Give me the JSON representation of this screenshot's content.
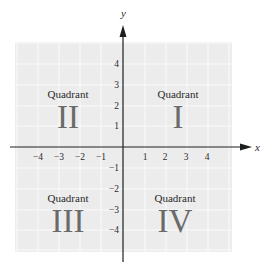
{
  "diagram": {
    "axes": {
      "x_label": "x",
      "y_label": "y"
    },
    "x_ticks": [
      {
        "value": -4,
        "label": "−4"
      },
      {
        "value": -3,
        "label": "−3"
      },
      {
        "value": -2,
        "label": "−2"
      },
      {
        "value": -1,
        "label": "−1"
      },
      {
        "value": 1,
        "label": "1"
      },
      {
        "value": 2,
        "label": "2"
      },
      {
        "value": 3,
        "label": "3"
      },
      {
        "value": 4,
        "label": "4"
      }
    ],
    "y_ticks": [
      {
        "value": 4,
        "label": "4"
      },
      {
        "value": 3,
        "label": "3"
      },
      {
        "value": 2,
        "label": "2"
      },
      {
        "value": 1,
        "label": "1"
      },
      {
        "value": -1,
        "label": "−1"
      },
      {
        "value": -2,
        "label": "−2"
      },
      {
        "value": -3,
        "label": "−3"
      },
      {
        "value": -4,
        "label": "−4"
      }
    ],
    "quadrants": [
      {
        "id": "I",
        "word": "Quadrant",
        "numeral": "I"
      },
      {
        "id": "II",
        "word": "Quadrant",
        "numeral": "II"
      },
      {
        "id": "III",
        "word": "Quadrant",
        "numeral": "III"
      },
      {
        "id": "IV",
        "word": "Quadrant",
        "numeral": "IV"
      }
    ],
    "colors": {
      "grid_background": "#ececec",
      "grid_lines": "#f8f8f8",
      "axis": "#1e1e1e",
      "numeral": "#6a6a6a"
    }
  }
}
